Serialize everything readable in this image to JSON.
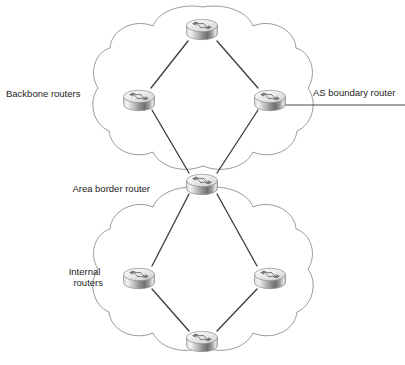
{
  "diagram": {
    "type": "network-topology",
    "canvas": {
      "width": 405,
      "height": 365
    },
    "colors": {
      "background": "#ffffff",
      "cloud_stroke": "#9a9a9a",
      "cloud_fill": "#ffffff",
      "link": "#3a3a3a",
      "text": "#1d1d1d",
      "router_top": "#f2f2f2",
      "router_body_light": "#fbfbfb",
      "router_body_dark": "#6e6e6e",
      "router_outline": "#8a8a8a"
    },
    "labels": [
      {
        "id": "backbone-routers",
        "text": "Backbone routers",
        "x": 6,
        "y": 97,
        "anchor": "start",
        "lines": [
          "Backbone routers"
        ]
      },
      {
        "id": "as-boundary-router",
        "text": "AS boundary router",
        "x": 313,
        "y": 96,
        "anchor": "start",
        "lines": [
          "AS boundary router"
        ]
      },
      {
        "id": "area-border-router",
        "text": "Area border router",
        "x": 150,
        "y": 192,
        "anchor": "end",
        "lines": [
          "Area border router"
        ]
      },
      {
        "id": "internal-routers",
        "text": "Internal routers",
        "x": 103,
        "y": 275,
        "anchor": "end",
        "lines": [
          "Internal",
          "routers"
        ]
      }
    ],
    "clouds": [
      {
        "id": "backbone-area-cloud",
        "name": "backbone area",
        "cx": 203,
        "cy": 97,
        "rx": 110,
        "ry": 92
      },
      {
        "id": "internal-area-cloud",
        "name": "internal area",
        "cx": 203,
        "cy": 278,
        "rx": 110,
        "ry": 92
      }
    ],
    "routers": [
      {
        "id": "router-backbone-top",
        "name": "backbone-top-router",
        "label": "Backbone routers",
        "x": 202,
        "y": 28,
        "scale": 1.0
      },
      {
        "id": "router-backbone-left",
        "name": "backbone-left-router",
        "label": "Backbone routers",
        "x": 139,
        "y": 99,
        "scale": 1.0
      },
      {
        "id": "router-as-boundary",
        "name": "as-boundary-router",
        "label": "AS boundary router",
        "x": 270,
        "y": 99,
        "scale": 1.0
      },
      {
        "id": "router-area-border",
        "name": "area-border-router",
        "label": "Area border router",
        "x": 202,
        "y": 183,
        "scale": 1.0
      },
      {
        "id": "router-internal-left",
        "name": "internal-left-router",
        "label": "Internal routers",
        "x": 139,
        "y": 277,
        "scale": 1.0
      },
      {
        "id": "router-internal-right",
        "name": "internal-right-router",
        "label": "Internal routers",
        "x": 270,
        "y": 277,
        "scale": 1.0
      },
      {
        "id": "router-internal-bottom",
        "name": "internal-bottom-router",
        "label": "Internal routers",
        "x": 202,
        "y": 340,
        "scale": 1.0
      }
    ],
    "links": [
      {
        "id": "link-top-left",
        "from": "router-backbone-top",
        "to": "router-backbone-left",
        "x1": 188,
        "y1": 41,
        "x2": 151,
        "y2": 88
      },
      {
        "id": "link-top-right",
        "from": "router-backbone-top",
        "to": "router-as-boundary",
        "x1": 217,
        "y1": 41,
        "x2": 258,
        "y2": 88
      },
      {
        "id": "link-left-border",
        "from": "router-backbone-left",
        "to": "router-area-border",
        "x1": 152,
        "y1": 110,
        "x2": 189,
        "y2": 173
      },
      {
        "id": "link-right-border",
        "from": "router-as-boundary",
        "to": "router-area-border",
        "x1": 258,
        "y1": 110,
        "x2": 217,
        "y2": 173
      },
      {
        "id": "link-border-internal-left",
        "from": "router-area-border",
        "to": "router-internal-left",
        "x1": 189,
        "y1": 194,
        "x2": 152,
        "y2": 266
      },
      {
        "id": "link-border-internal-right",
        "from": "router-area-border",
        "to": "router-internal-right",
        "x1": 217,
        "y1": 194,
        "x2": 257,
        "y2": 266
      },
      {
        "id": "link-internal-left-bottom",
        "from": "router-internal-left",
        "to": "router-internal-bottom",
        "x1": 152,
        "y1": 289,
        "x2": 189,
        "y2": 331
      },
      {
        "id": "link-internal-right-bottom",
        "from": "router-internal-right",
        "to": "router-internal-bottom",
        "x1": 257,
        "y1": 289,
        "x2": 217,
        "y2": 331
      }
    ],
    "as_link": {
      "id": "as-boundary-external-link",
      "name": "as-boundary-external-link",
      "x1": 283,
      "y1": 105,
      "x2": 405,
      "y2": 105
    }
  }
}
